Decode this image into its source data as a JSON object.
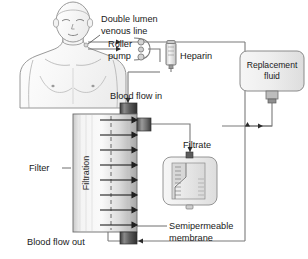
{
  "diagram": {
    "background_color": "#ffffff",
    "line_color": "#7a7a7a",
    "text_color": "#1a1a1a"
  },
  "labels": {
    "double_lumen_line_1": "Double lumen",
    "double_lumen_line_2": "venous line",
    "roller_pump_1": "Roller",
    "roller_pump_2": "pump",
    "heparin": "Heparin",
    "blood_flow_in": "Blood flow in",
    "blood_flow_out": "Blood flow out",
    "filter": "Filter",
    "filtration": "Filtration",
    "filtrate": "Filtrate",
    "semipermeable_1": "Semipermeable",
    "semipermeable_2": "membrane",
    "replacement_fluid_1": "Replacement",
    "replacement_fluid_2": "fluid"
  },
  "components": {
    "patient": {
      "name": "patient-torso",
      "fill": "#fbfbfb",
      "outline": "#8d8d8d"
    },
    "roller_pump": {
      "name": "roller-pump",
      "roller_count": 3,
      "roller_fill": "#d2d2d2"
    },
    "heparin_syringe": {
      "name": "heparin-syringe",
      "fill": "#e3e3e3"
    },
    "filter": {
      "name": "haemofilter",
      "arrow_count": 8,
      "membrane_style": "dashed",
      "body_fill_light": "#f2f2f2",
      "body_fill_dark": "#b5b5b5",
      "cap_fill": "#4a4a4a"
    },
    "filtrate_bag": {
      "name": "filtrate-collection-bag",
      "fill": "#efefef",
      "graduations": 9
    },
    "replacement_bag": {
      "name": "replacement-fluid-bag",
      "fill": "#e8e8e8"
    }
  }
}
